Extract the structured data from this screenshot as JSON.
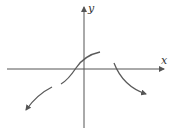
{
  "diagram": {
    "type": "function-graph-sketch",
    "axes": {
      "x_label": "x",
      "y_label": "y",
      "color": "#555555"
    },
    "curve_color": "#5a5a5a",
    "segments": [
      {
        "name": "lower-left-branch",
        "description": "decreasing toward bottom-left with arrow",
        "arrow": "end"
      },
      {
        "name": "middle-s-branch",
        "description": "increasing through origin, leveling off above x-axis",
        "arrow": "none"
      },
      {
        "name": "right-branch",
        "description": "starting on x-axis, decreasing toward bottom-right with arrow",
        "arrow": "end"
      }
    ]
  }
}
